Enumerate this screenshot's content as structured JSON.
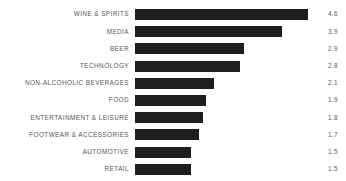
{
  "chart_data": {
    "type": "bar",
    "orientation": "horizontal",
    "title": "",
    "subtitle": "",
    "xlabel": "",
    "ylabel": "",
    "grid": false,
    "legend": false,
    "xlim": [
      0,
      4.6
    ],
    "categories": [
      "WINE & SPIRITS",
      "MEDIA",
      "BEER",
      "TECHNOLOGY",
      "NON-ALCOHOLIC BEVERAGES",
      "FOOD",
      "ENTERTAINMENT & LEISURE",
      "FOOTWEAR & ACCESSORIES",
      "AUTOMOTIVE",
      "RETAIL"
    ],
    "values": [
      4.6,
      3.9,
      2.9,
      2.8,
      2.1,
      1.9,
      1.8,
      1.7,
      1.5,
      1.5
    ],
    "value_labels": [
      "4.6",
      "3.9",
      "2.9",
      "2.8",
      "2.1",
      "1.9",
      "1.8",
      "1.7",
      "1.5",
      "1.5"
    ],
    "bar_color": "#1e1e1e",
    "label_color": "#58585a",
    "background_color": "#ffffff"
  },
  "rows": [
    {
      "label": "WINE & SPIRITS",
      "value": 4.6,
      "value_label": "4.6"
    },
    {
      "label": "MEDIA",
      "value": 3.9,
      "value_label": "3.9"
    },
    {
      "label": "BEER",
      "value": 2.9,
      "value_label": "2.9"
    },
    {
      "label": "TECHNOLOGY",
      "value": 2.8,
      "value_label": "2.8"
    },
    {
      "label": "NON-ALCOHOLIC BEVERAGES",
      "value": 2.1,
      "value_label": "2.1"
    },
    {
      "label": "FOOD",
      "value": 1.9,
      "value_label": "1.9"
    },
    {
      "label": "ENTERTAINMENT & LEISURE",
      "value": 1.8,
      "value_label": "1.8"
    },
    {
      "label": "FOOTWEAR & ACCESSORIES",
      "value": 1.7,
      "value_label": "1.7"
    },
    {
      "label": "AUTOMOTIVE",
      "value": 1.5,
      "value_label": "1.5"
    },
    {
      "label": "RETAIL",
      "value": 1.5,
      "value_label": "1.5"
    }
  ]
}
